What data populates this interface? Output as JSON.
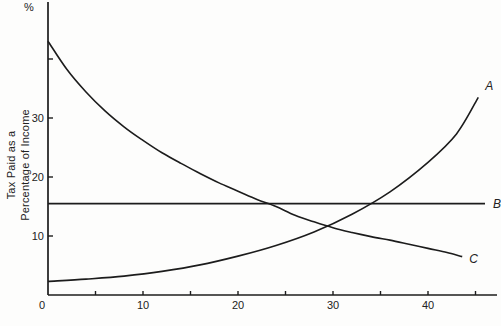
{
  "figure": {
    "percent_label": "%",
    "y_axis_title_line1": "Tax Paid as a",
    "y_axis_title_line2": "Percentage of Income"
  },
  "chart_data": {
    "type": "line",
    "title": "",
    "xlabel": "",
    "ylabel": "Tax Paid as a Percentage of Income",
    "y_unit_label": "%",
    "xlim": [
      0,
      47.5
    ],
    "ylim": [
      0,
      49.5
    ],
    "grid": false,
    "legend_position": "curve-end-labels",
    "x_ticks_minor": [
      5,
      15,
      25,
      35,
      45
    ],
    "x_ticks_labeled": [
      10,
      20,
      30,
      40
    ],
    "origin_label": "0",
    "y_ticks": [
      10,
      20,
      30,
      40
    ],
    "y_ticks_labeled": [
      10,
      20,
      30
    ],
    "line_color": "#1c1c1c",
    "series": [
      {
        "name": "progressive-tax",
        "label": "A",
        "label_dx": 7,
        "label_dy": -7,
        "points": [
          [
            0,
            2.3
          ],
          [
            4,
            2.7
          ],
          [
            8,
            3.2
          ],
          [
            12,
            4.0
          ],
          [
            16,
            5.1
          ],
          [
            20,
            6.6
          ],
          [
            24,
            8.4
          ],
          [
            28,
            10.7
          ],
          [
            32,
            13.7
          ],
          [
            36,
            17.5
          ],
          [
            40,
            22.5
          ],
          [
            43,
            27.3
          ],
          [
            45.3,
            33.5
          ]
        ]
      },
      {
        "name": "proportional-tax",
        "label": "B",
        "label_dx": 8,
        "label_dy": 4,
        "points": [
          [
            0,
            15.5
          ],
          [
            46,
            15.5
          ]
        ]
      },
      {
        "name": "regressive-tax",
        "label": "C",
        "label_dx": 7,
        "label_dy": 6,
        "points": [
          [
            0,
            43
          ],
          [
            2,
            38.2
          ],
          [
            4,
            34.4
          ],
          [
            6,
            31.2
          ],
          [
            8,
            28.5
          ],
          [
            10,
            26.2
          ],
          [
            12,
            24.1
          ],
          [
            14,
            22.3
          ],
          [
            16,
            20.6
          ],
          [
            18,
            19.0
          ],
          [
            20,
            17.6
          ],
          [
            22,
            16.2
          ],
          [
            24,
            15.0
          ],
          [
            26,
            13.5
          ],
          [
            28,
            12.4
          ],
          [
            30,
            11.4
          ],
          [
            32,
            10.6
          ],
          [
            34,
            9.9
          ],
          [
            36,
            9.3
          ],
          [
            38,
            8.6
          ],
          [
            40,
            7.9
          ],
          [
            42,
            7.2
          ],
          [
            43.6,
            6.5
          ]
        ]
      }
    ],
    "plot": {
      "x0": 48,
      "y0": 295,
      "px_per_unit_x": 9.5,
      "px_per_unit_y": 5.9,
      "y_axis_top": 2,
      "x_axis_right": 497,
      "tick_len": 4
    }
  }
}
